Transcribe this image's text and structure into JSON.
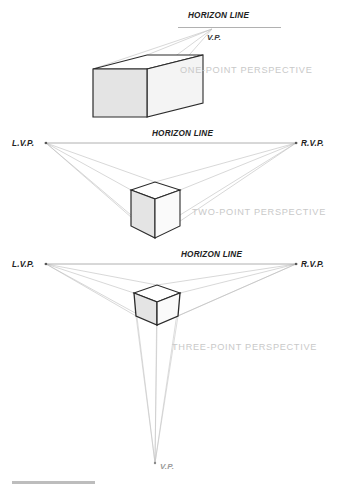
{
  "figure": {
    "title_alt": "Perspective construction diagram",
    "background_color": "#ffffff",
    "panels": [
      {
        "id": "one-point",
        "caption": "ONE-POINT PERSPECTIVE",
        "horizon_label": "HORIZON LINE",
        "vanishing_points": [
          {
            "label": "V.P.",
            "position": "center-right"
          }
        ]
      },
      {
        "id": "two-point",
        "caption": "TWO-POINT PERSPECTIVE",
        "horizon_label": "HORIZON LINE",
        "vanishing_points": [
          {
            "label": "L.V.P.",
            "position": "left"
          },
          {
            "label": "R.V.P.",
            "position": "right"
          }
        ]
      },
      {
        "id": "three-point",
        "caption": "THREE-POINT PERSPECTIVE",
        "horizon_label": "HORIZON LINE",
        "vanishing_points": [
          {
            "label": "L.V.P.",
            "position": "left"
          },
          {
            "label": "R.V.P.",
            "position": "right"
          },
          {
            "label": "V.P.",
            "position": "bottom"
          }
        ]
      }
    ],
    "colors": {
      "cube_outline": "#2b2b2b",
      "cube_face_light": "#ffffff",
      "cube_face_shade": "#e6e6e6",
      "cube_face_mid": "#f2f2f2",
      "guide_line": "#b9b9b9",
      "horizon_line": "#9d9d9d",
      "caption_text": "#c9c9c9",
      "label_text": "#222222",
      "footer_rule": "#bdbdbd"
    }
  }
}
